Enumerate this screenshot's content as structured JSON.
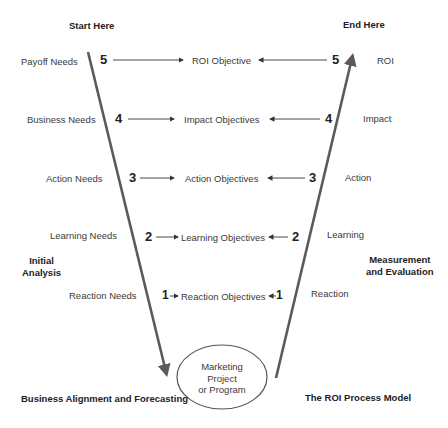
{
  "headers": {
    "start": "Start Here",
    "end": "End Here"
  },
  "side_labels": {
    "left": "Initial\nAnalysis",
    "left_lines": [
      "Initial",
      "Analysis"
    ],
    "right_lines": [
      "Measurement",
      "and Evaluation"
    ]
  },
  "footer": {
    "left": "Business Alignment and Forecasting",
    "right": "The ROI Process Model"
  },
  "center": {
    "lines": [
      "Marketing",
      "Project",
      "or Program"
    ]
  },
  "levels": [
    {
      "number": "5",
      "need": "Payoff Needs",
      "objective": "ROI Objective",
      "measure": "ROI"
    },
    {
      "number": "4",
      "need": "Business Needs",
      "objective": "Impact Objectives",
      "measure": "Impact"
    },
    {
      "number": "3",
      "need": "Action Needs",
      "objective": "Action Objectives",
      "measure": "Action"
    },
    {
      "number": "2",
      "need": "Learning Needs",
      "objective": "Learning Objectives",
      "measure": "Learning"
    },
    {
      "number": "1",
      "need": "Reaction Needs",
      "objective": "Reaction Objectives",
      "measure": "Reaction"
    }
  ],
  "colors": {
    "line": "#5a5a5a",
    "text": "#3a3a3a"
  }
}
